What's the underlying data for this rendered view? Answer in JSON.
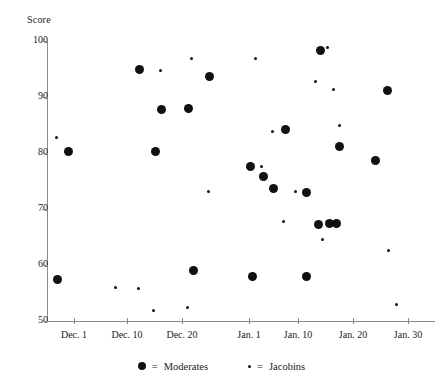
{
  "chart_data": {
    "type": "scatter",
    "title": "",
    "xlabel": "",
    "ylabel": "Score",
    "ylim": [
      50,
      100
    ],
    "y_ticks": [
      100,
      90,
      80,
      70,
      60,
      50
    ],
    "x_ticks": [
      "Dec. 1",
      "Dec. 10",
      "Dec. 20",
      "Jan. 1",
      "Jan. 10",
      "Jan. 20",
      "Jan. 30"
    ],
    "x_tick_px": [
      74,
      127,
      182,
      249,
      298,
      353,
      408
    ],
    "grid": false,
    "legend_position": "bottom-center",
    "series": [
      {
        "name": "Moderates",
        "marker": "large-filled-circle",
        "color": "#111111",
        "points": [
          {
            "x_px": 68,
            "y_px": 151,
            "date": "Dec. 1",
            "score": 80.4
          },
          {
            "x_px": 57,
            "y_px": 279,
            "date": "Nov. 28",
            "score": 57.5
          },
          {
            "x_px": 139,
            "y_px": 69,
            "date": "Dec. 12",
            "score": 95.0
          },
          {
            "x_px": 155,
            "y_px": 151,
            "date": "Dec. 15",
            "score": 80.4
          },
          {
            "x_px": 161,
            "y_px": 109,
            "date": "Dec. 16",
            "score": 87.9
          },
          {
            "x_px": 188,
            "y_px": 108,
            "date": "Dec. 21",
            "score": 88.0
          },
          {
            "x_px": 193,
            "y_px": 270,
            "date": "Dec. 22",
            "score": 59.1
          },
          {
            "x_px": 209,
            "y_px": 76,
            "date": "Dec. 25",
            "score": 93.8
          },
          {
            "x_px": 250,
            "y_px": 166,
            "date": "Jan. 1",
            "score": 77.7
          },
          {
            "x_px": 252,
            "y_px": 276,
            "date": "Jan. 1",
            "score": 58.0
          },
          {
            "x_px": 263,
            "y_px": 176,
            "date": "Jan. 3",
            "score": 75.9
          },
          {
            "x_px": 273,
            "y_px": 188,
            "date": "Jan. 5",
            "score": 73.8
          },
          {
            "x_px": 285,
            "y_px": 129,
            "date": "Jan. 7",
            "score": 84.3
          },
          {
            "x_px": 306,
            "y_px": 192,
            "date": "Jan. 11",
            "score": 73.0
          },
          {
            "x_px": 306,
            "y_px": 276,
            "date": "Jan. 11",
            "score": 58.0
          },
          {
            "x_px": 318,
            "y_px": 224,
            "date": "Jan. 13",
            "score": 67.3
          },
          {
            "x_px": 320,
            "y_px": 50,
            "date": "Jan. 14",
            "score": 98.4
          },
          {
            "x_px": 329,
            "y_px": 223,
            "date": "Jan. 15",
            "score": 67.5
          },
          {
            "x_px": 336,
            "y_px": 223,
            "date": "Jan. 17",
            "score": 67.5
          },
          {
            "x_px": 339,
            "y_px": 146,
            "date": "Jan. 17",
            "score": 81.3
          },
          {
            "x_px": 375,
            "y_px": 160,
            "date": "Jan. 24",
            "score": 78.8
          },
          {
            "x_px": 387,
            "y_px": 90,
            "date": "Jan. 26",
            "score": 91.3
          }
        ]
      },
      {
        "name": "Jacobins",
        "marker": "small-filled-dot",
        "color": "#111111",
        "points": [
          {
            "x_px": 56,
            "y_px": 137,
            "date": "Nov. 28",
            "score": 82.9
          },
          {
            "x_px": 115,
            "y_px": 287,
            "date": "Dec. 8",
            "score": 56.1
          },
          {
            "x_px": 138,
            "y_px": 288,
            "date": "Dec. 12",
            "score": 55.9
          },
          {
            "x_px": 153,
            "y_px": 310,
            "date": "Dec. 14",
            "score": 52.0
          },
          {
            "x_px": 160,
            "y_px": 70,
            "date": "Dec. 16",
            "score": 94.8
          },
          {
            "x_px": 187,
            "y_px": 307,
            "date": "Dec. 21",
            "score": 52.5
          },
          {
            "x_px": 191,
            "y_px": 58,
            "date": "Dec. 22",
            "score": 96.9
          },
          {
            "x_px": 208,
            "y_px": 191,
            "date": "Dec. 25",
            "score": 73.2
          },
          {
            "x_px": 255,
            "y_px": 58,
            "date": "Jan. 2",
            "score": 97.0
          },
          {
            "x_px": 261,
            "y_px": 166,
            "date": "Jan. 3",
            "score": 77.7
          },
          {
            "x_px": 272,
            "y_px": 131,
            "date": "Jan. 4",
            "score": 83.9
          },
          {
            "x_px": 283,
            "y_px": 221,
            "date": "Jan. 6",
            "score": 67.9
          },
          {
            "x_px": 295,
            "y_px": 191,
            "date": "Jan. 9",
            "score": 73.2
          },
          {
            "x_px": 315,
            "y_px": 81,
            "date": "Jan. 12",
            "score": 92.9
          },
          {
            "x_px": 322,
            "y_px": 239,
            "date": "Jan. 14",
            "score": 64.6
          },
          {
            "x_px": 327,
            "y_px": 47,
            "date": "Jan. 15",
            "score": 99.0
          },
          {
            "x_px": 333,
            "y_px": 89,
            "date": "Jan. 16",
            "score": 91.4
          },
          {
            "x_px": 339,
            "y_px": 125,
            "date": "Jan. 17",
            "score": 85.0
          },
          {
            "x_px": 388,
            "y_px": 250,
            "date": "Jan. 26",
            "score": 62.7
          },
          {
            "x_px": 396,
            "y_px": 304,
            "date": "Jan. 28",
            "score": 53.0
          }
        ]
      }
    ]
  },
  "legend": {
    "entries": [
      {
        "equals": "=",
        "label": "Moderates",
        "marker": "moderate"
      },
      {
        "equals": "=",
        "label": "Jacobins",
        "marker": "jacobin"
      }
    ]
  }
}
